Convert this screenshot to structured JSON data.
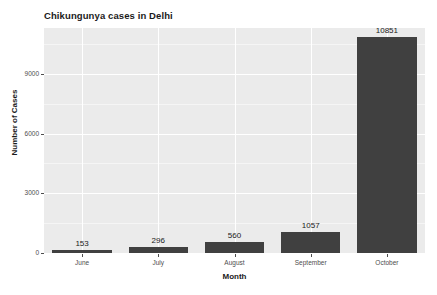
{
  "chart_data": {
    "type": "bar",
    "title": "Chikungunya cases in Delhi",
    "xlabel": "Month",
    "ylabel": "Number of Cases",
    "categories": [
      "June",
      "July",
      "August",
      "September",
      "October"
    ],
    "values": [
      153,
      296,
      560,
      1057,
      10851
    ],
    "value_labels": [
      "153",
      "296",
      "560",
      "1057",
      "10851"
    ],
    "ylim": [
      0,
      11300
    ],
    "y_ticks": [
      0,
      3000,
      6000,
      9000
    ],
    "y_tick_labels": [
      "0",
      "3000",
      "6000",
      "9000"
    ],
    "grid": true,
    "legend": "none",
    "bar_color": "#404040",
    "panel_background": "#ebebeb",
    "gridline_color": "#ffffff",
    "text_color": "#1a1a1a"
  }
}
